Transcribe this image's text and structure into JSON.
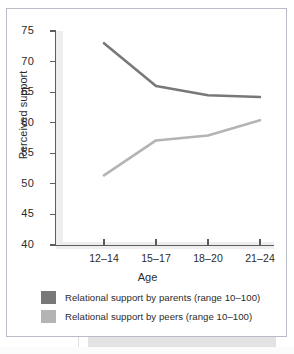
{
  "chart_data": {
    "type": "line",
    "title": "",
    "xlabel": "Age",
    "ylabel": "Perceived support",
    "categories": [
      "12–14",
      "15–17",
      "18–20",
      "21–24"
    ],
    "ylim": [
      40,
      75
    ],
    "yticks": [
      40,
      45,
      50,
      55,
      60,
      65,
      70,
      75
    ],
    "grid": false,
    "legend_position": "bottom",
    "series": [
      {
        "name": "Relational support by parents (range 10–100)",
        "color": "#787878",
        "values": [
          73.0,
          66.0,
          64.5,
          64.2
        ]
      },
      {
        "name": "Relational support by peers (range 10–100)",
        "color": "#b4b4b4",
        "values": [
          51.4,
          57.1,
          57.9,
          60.4
        ]
      }
    ]
  },
  "axes": {
    "y_label": "Perceived support",
    "x_label": "Age",
    "y_tick_labels": [
      "75",
      "70",
      "65",
      "60",
      "55",
      "50",
      "45",
      "40"
    ],
    "x_tick_labels": [
      "12–14",
      "15–17",
      "18–20",
      "21–24"
    ]
  },
  "legend": {
    "items": [
      {
        "label": "Relational support by parents (range 10–100)",
        "color": "#787878"
      },
      {
        "label": "Relational support by peers (range 10–100)",
        "color": "#b4b4b4"
      }
    ]
  },
  "colors": {
    "parents": "#787878",
    "peers": "#b4b4b4",
    "axis": "#5d5d5d",
    "frame": "#b9bcc6",
    "text": "#2b2b2b"
  }
}
